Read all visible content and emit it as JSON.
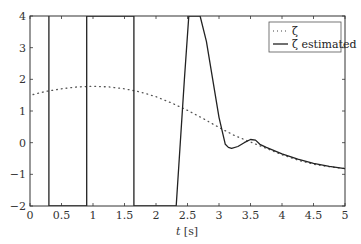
{
  "chart_data": {
    "type": "line",
    "title": "",
    "xlabel": "t [s]",
    "ylabel": "",
    "xlim": [
      0,
      5
    ],
    "ylim": [
      -2,
      4
    ],
    "xticks": [
      0,
      0.5,
      1,
      1.5,
      2,
      2.5,
      3,
      3.5,
      4,
      4.5,
      5
    ],
    "xtick_labels": [
      "0",
      "0.5",
      "1",
      "1.5",
      "2",
      "2.5",
      "3",
      "3.5",
      "4",
      "4.5",
      "5"
    ],
    "yticks": [
      -2,
      -1,
      0,
      1,
      2,
      3,
      4
    ],
    "ytick_labels": [
      "−2",
      "−1",
      "0",
      "1",
      "2",
      "3",
      "4"
    ],
    "grid": false,
    "legend_position": "upper right",
    "series": [
      {
        "name": "ζ",
        "style": "dotted",
        "x": [
          0.05,
          0.25,
          0.5,
          0.75,
          1.0,
          1.25,
          1.5,
          1.75,
          2.0,
          2.25,
          2.5,
          2.75,
          3.0,
          3.25,
          3.5,
          3.75,
          4.0,
          4.25,
          4.5,
          4.75,
          5.0
        ],
        "y": [
          1.52,
          1.62,
          1.7,
          1.76,
          1.78,
          1.76,
          1.7,
          1.6,
          1.45,
          1.25,
          1.02,
          0.76,
          0.48,
          0.22,
          0.02,
          -0.18,
          -0.38,
          -0.55,
          -0.68,
          -0.76,
          -0.82
        ]
      },
      {
        "name": "ζ estimated",
        "style": "solid",
        "x": [
          0.3,
          0.3,
          0.9,
          0.9,
          1.65,
          1.65,
          2.32,
          2.45,
          2.52,
          2.6,
          2.7,
          2.8,
          2.9,
          3.0,
          3.1,
          3.15,
          3.2,
          3.3,
          3.4,
          3.5,
          3.58,
          3.65,
          3.75,
          4.0,
          4.25,
          4.5,
          4.75,
          5.0
        ],
        "y": [
          4.0,
          -2.0,
          -2.0,
          4.0,
          4.0,
          -2.0,
          -2.0,
          2.0,
          4.0,
          4.0,
          4.0,
          3.2,
          2.0,
          0.8,
          -0.05,
          -0.15,
          -0.18,
          -0.12,
          0.0,
          0.1,
          0.08,
          -0.05,
          -0.15,
          -0.35,
          -0.52,
          -0.65,
          -0.75,
          -0.82
        ]
      }
    ]
  },
  "legend": {
    "items": [
      {
        "label": "ζ",
        "style": "dotted"
      },
      {
        "label": "ζ estimated",
        "style": "solid"
      }
    ]
  },
  "colors": {
    "line": "#222222",
    "axis": "#333333",
    "background": "#ffffff"
  }
}
